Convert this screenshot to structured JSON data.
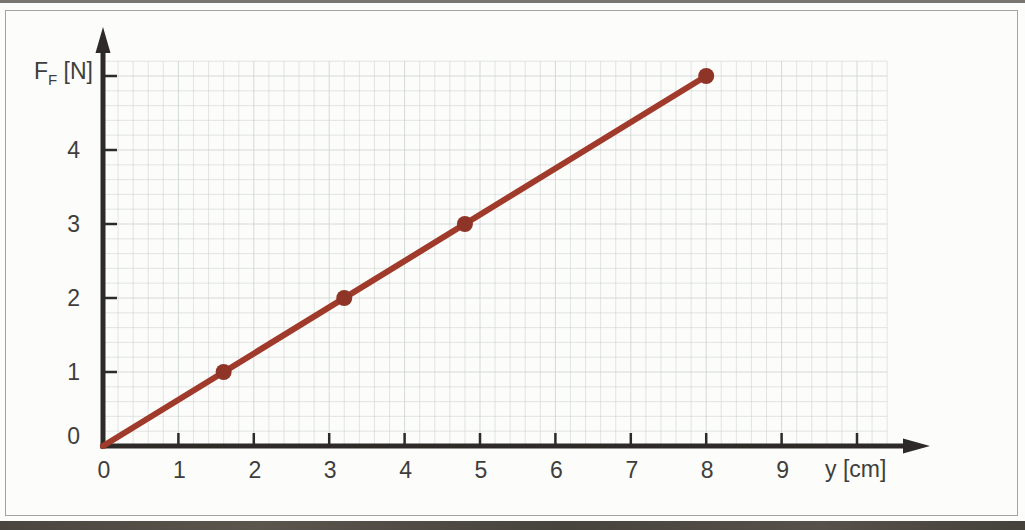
{
  "figure": {
    "background": "#fcfcfa",
    "frame_border": "#a3a3a1"
  },
  "chart_data": {
    "type": "line",
    "title": "",
    "xlabel": "y [cm]",
    "ylabel": "F_F [N]",
    "ylabel_parts": {
      "main": "F",
      "sub": "F",
      "unit": " [N]"
    },
    "xlim": [
      0,
      10.4
    ],
    "ylim": [
      0,
      5.2
    ],
    "grid": {
      "on": true,
      "minor_subdivisions_per_unit": 5,
      "style": "light fine squared grid"
    },
    "legend": "none",
    "x_axis": {
      "label": "y [cm]",
      "ticks": [
        {
          "v": 0,
          "t": "0"
        },
        {
          "v": 1,
          "t": "1"
        },
        {
          "v": 2,
          "t": "2"
        },
        {
          "v": 3,
          "t": "3"
        },
        {
          "v": 4,
          "t": "4"
        },
        {
          "v": 5,
          "t": "5"
        },
        {
          "v": 6,
          "t": "6"
        },
        {
          "v": 7,
          "t": "7"
        },
        {
          "v": 8,
          "t": "8"
        },
        {
          "v": 9,
          "t": "9"
        },
        {
          "v": 10,
          "t": ""
        }
      ]
    },
    "y_axis": {
      "label": "F_F [N]",
      "ticks": [
        {
          "v": 0,
          "t": "0"
        },
        {
          "v": 1,
          "t": "1"
        },
        {
          "v": 2,
          "t": "2"
        },
        {
          "v": 3,
          "t": "3"
        },
        {
          "v": 4,
          "t": "4"
        },
        {
          "v": 5,
          "t": ""
        }
      ]
    },
    "series": [
      {
        "name": "F_F vs y",
        "line_endpoints": [
          [
            0,
            0
          ],
          [
            8,
            5
          ]
        ],
        "points": [
          [
            1.6,
            1
          ],
          [
            3.2,
            2
          ],
          [
            4.8,
            3
          ],
          [
            8,
            5
          ]
        ]
      }
    ],
    "colors": {
      "line": "#a03a2b",
      "point": "#8e3527",
      "axis": "#2d2a27",
      "grid": "#c9d0ce",
      "tick_label": "#3f3e3c",
      "frame": "#a3a3a1"
    }
  }
}
